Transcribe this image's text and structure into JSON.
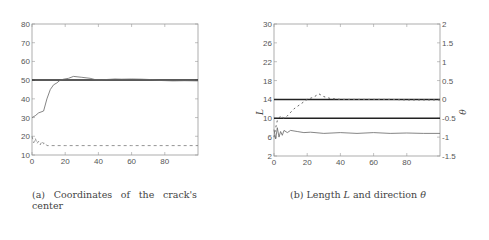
{
  "captions": {
    "a": "(a)  Coordinates  of  the  crack's center",
    "b_prefix": "(b) Length ",
    "b_L": "L",
    "b_mid": " and direction ",
    "b_theta": "θ"
  },
  "chart_data": [
    {
      "type": "line",
      "title": "(a) Coordinates of the crack's center",
      "xlabel": "",
      "ylabel": "",
      "xlim": [
        0,
        100
      ],
      "ylim": [
        10,
        80
      ],
      "xticks": [
        0,
        20,
        40,
        60,
        80
      ],
      "yticks": [
        10,
        20,
        30,
        40,
        50,
        60,
        70,
        80
      ],
      "grid": false,
      "series": [
        {
          "name": "true x-coordinate",
          "style": "thick solid",
          "x": [
            0,
            100
          ],
          "values": [
            50,
            50
          ]
        },
        {
          "name": "estimated x-coordinate",
          "style": "thin solid",
          "x": [
            0,
            2,
            4,
            7,
            9,
            11,
            13,
            15,
            17,
            19,
            22,
            25,
            30,
            35,
            38,
            42,
            46,
            50,
            54,
            60,
            66,
            72,
            78,
            85,
            92,
            100
          ],
          "values": [
            30,
            31,
            32.5,
            33.5,
            40,
            45,
            47.5,
            48.5,
            50,
            50.5,
            51,
            52,
            51.5,
            51,
            50.3,
            50.2,
            50.4,
            50.6,
            50.5,
            50.6,
            50.5,
            50.3,
            49.8,
            49.6,
            49.7,
            49.6
          ]
        },
        {
          "name": "estimated y-coordinate",
          "style": "dashed",
          "x": [
            0,
            1,
            2,
            3,
            4,
            5,
            6,
            7,
            8,
            9,
            10,
            15,
            20,
            40,
            60,
            80,
            100
          ],
          "values": [
            20,
            16.5,
            19,
            16,
            17.5,
            15.5,
            17.5,
            16,
            16.5,
            15,
            15,
            15,
            15,
            15,
            15,
            15,
            15
          ]
        }
      ]
    },
    {
      "type": "line",
      "title": "(b) Length L and direction θ",
      "xlabel": "",
      "ylabel": "L",
      "y2label": "θ",
      "xlim": [
        0,
        100
      ],
      "ylim": [
        2,
        30
      ],
      "y2lim": [
        -1.5,
        2
      ],
      "xticks": [
        0,
        20,
        40,
        60,
        80
      ],
      "yticks": [
        2,
        6,
        10,
        14,
        18,
        22,
        26,
        30
      ],
      "y2ticks": [
        -1.5,
        -1,
        -0.5,
        0,
        0.5,
        1,
        1.5,
        2
      ],
      "grid": false,
      "series": [
        {
          "name": "true L",
          "style": "thick solid",
          "axis": "L",
          "x": [
            0,
            100
          ],
          "values": [
            14,
            14
          ]
        },
        {
          "name": "true θ",
          "style": "thick solid",
          "axis": "θ",
          "x": [
            0,
            100
          ],
          "values": [
            -0.5,
            -0.5
          ]
        },
        {
          "name": "estimated L",
          "style": "dotted",
          "axis": "L",
          "x": [
            0,
            1,
            2,
            4,
            6,
            8,
            12,
            16,
            20,
            24,
            27,
            30,
            34,
            40,
            50,
            60,
            70,
            80,
            90,
            100
          ],
          "values": [
            6,
            8,
            9.5,
            10.5,
            10,
            10.5,
            12,
            13,
            14,
            14.5,
            15.2,
            14.6,
            14.2,
            14,
            14,
            14,
            14,
            13.9,
            13.9,
            13.9
          ]
        },
        {
          "name": "estimated θ",
          "style": "thin solid",
          "axis": "θ",
          "x": [
            0,
            1,
            2,
            3,
            4,
            5,
            6,
            8,
            10,
            14,
            18,
            22,
            30,
            40,
            50,
            60,
            70,
            80,
            90,
            100
          ],
          "values": [
            -0.8,
            -1.05,
            -0.75,
            -1.0,
            -0.85,
            -0.95,
            -0.82,
            -0.88,
            -0.82,
            -0.85,
            -0.88,
            -0.87,
            -0.9,
            -0.88,
            -0.9,
            -0.88,
            -0.9,
            -0.89,
            -0.9,
            -0.9
          ]
        }
      ]
    }
  ]
}
